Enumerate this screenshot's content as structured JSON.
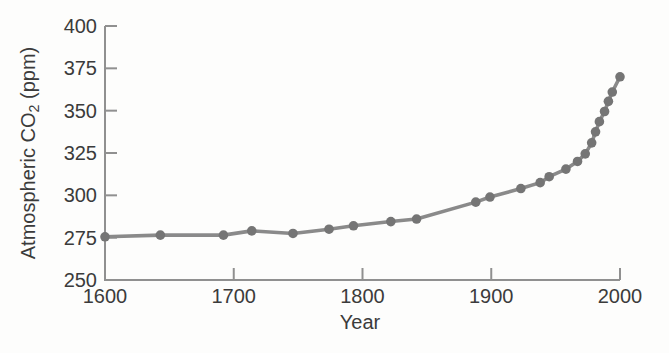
{
  "chart_data": {
    "type": "line",
    "title": "",
    "xlabel": "Year",
    "ylabel": "Atmospheric CO2 (ppm)",
    "ylabel_parts": {
      "prefix": "Atmospheric CO",
      "subscript": "2",
      "suffix": " (ppm)"
    },
    "xlim": [
      1600,
      2000
    ],
    "ylim": [
      250,
      400
    ],
    "x_ticks": [
      1600,
      1700,
      1800,
      1900,
      2000
    ],
    "y_ticks": [
      250,
      275,
      300,
      325,
      350,
      375,
      400
    ],
    "grid": false,
    "legend": "none",
    "series": [
      {
        "name": "Atmospheric CO2 concentration",
        "points": [
          {
            "year": 1600,
            "ppm": 275.5
          },
          {
            "year": 1643,
            "ppm": 276.5
          },
          {
            "year": 1692,
            "ppm": 276.5
          },
          {
            "year": 1714,
            "ppm": 279
          },
          {
            "year": 1746,
            "ppm": 277.5
          },
          {
            "year": 1774,
            "ppm": 280
          },
          {
            "year": 1793,
            "ppm": 282
          },
          {
            "year": 1822,
            "ppm": 284.5
          },
          {
            "year": 1842,
            "ppm": 286
          },
          {
            "year": 1888,
            "ppm": 296
          },
          {
            "year": 1899,
            "ppm": 299
          },
          {
            "year": 1923,
            "ppm": 304
          },
          {
            "year": 1938,
            "ppm": 307.5
          },
          {
            "year": 1945,
            "ppm": 311
          },
          {
            "year": 1958,
            "ppm": 315.5
          },
          {
            "year": 1967,
            "ppm": 320
          },
          {
            "year": 1973,
            "ppm": 324.5
          },
          {
            "year": 1978,
            "ppm": 331
          },
          {
            "year": 1981,
            "ppm": 337.5
          },
          {
            "year": 1984,
            "ppm": 343.5
          },
          {
            "year": 1988,
            "ppm": 349.5
          },
          {
            "year": 1991,
            "ppm": 355.5
          },
          {
            "year": 1994,
            "ppm": 361
          },
          {
            "year": 2000,
            "ppm": 370
          }
        ]
      }
    ],
    "colors": {
      "line": "#8a8a8a",
      "marker": "#757575",
      "axis": "#909090",
      "text": "#3b3b3b",
      "background": "#fdfdfc"
    }
  }
}
